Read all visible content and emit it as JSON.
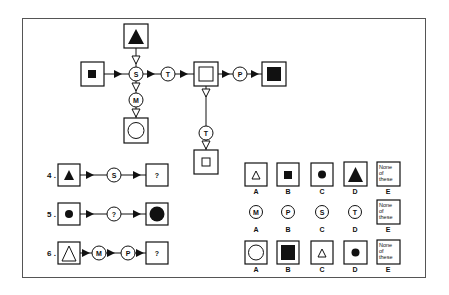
{
  "diagram": {
    "key_nodes": {
      "S": "S",
      "T": "T",
      "M": "M",
      "P": "P"
    },
    "key_description": "Transformation key: S, T, M, P operators applied to shapes in boxes"
  },
  "questions": [
    {
      "number": "4 .",
      "input": "small filled triangle",
      "operators": [
        "S"
      ],
      "output": "?"
    },
    {
      "number": "5 .",
      "input": "small filled circle",
      "operators": [
        "?"
      ],
      "output": "large filled circle"
    },
    {
      "number": "6 .",
      "input": "large hollow triangle",
      "operators": [
        "M",
        "P"
      ],
      "output": "?"
    }
  ],
  "answer_rows": [
    {
      "options": [
        {
          "letter": "A",
          "content": "small hollow triangle"
        },
        {
          "letter": "B",
          "content": "small filled square"
        },
        {
          "letter": "C",
          "content": "small filled circle"
        },
        {
          "letter": "D",
          "content": "large filled triangle"
        },
        {
          "letter": "E",
          "content": "None of these"
        }
      ]
    },
    {
      "options": [
        {
          "letter": "A",
          "content": "M"
        },
        {
          "letter": "B",
          "content": "P"
        },
        {
          "letter": "C",
          "content": "S"
        },
        {
          "letter": "D",
          "content": "T"
        },
        {
          "letter": "E",
          "content": "None of these"
        }
      ]
    },
    {
      "options": [
        {
          "letter": "A",
          "content": "large hollow circle"
        },
        {
          "letter": "B",
          "content": "large filled square"
        },
        {
          "letter": "C",
          "content": "small hollow triangle"
        },
        {
          "letter": "D",
          "content": "small filled circle"
        },
        {
          "letter": "E",
          "content": "None of these"
        }
      ]
    }
  ],
  "labels": {
    "q4": "4 .",
    "q5": "5 .",
    "q6": "6 .",
    "q": "?",
    "none1": "None",
    "none2": "of",
    "none3": "these",
    "A": "A",
    "B": "B",
    "C": "C",
    "D": "D",
    "E": "E"
  },
  "colors": {
    "ink": "#111111",
    "frame": "#555555",
    "background": "#ffffff"
  }
}
